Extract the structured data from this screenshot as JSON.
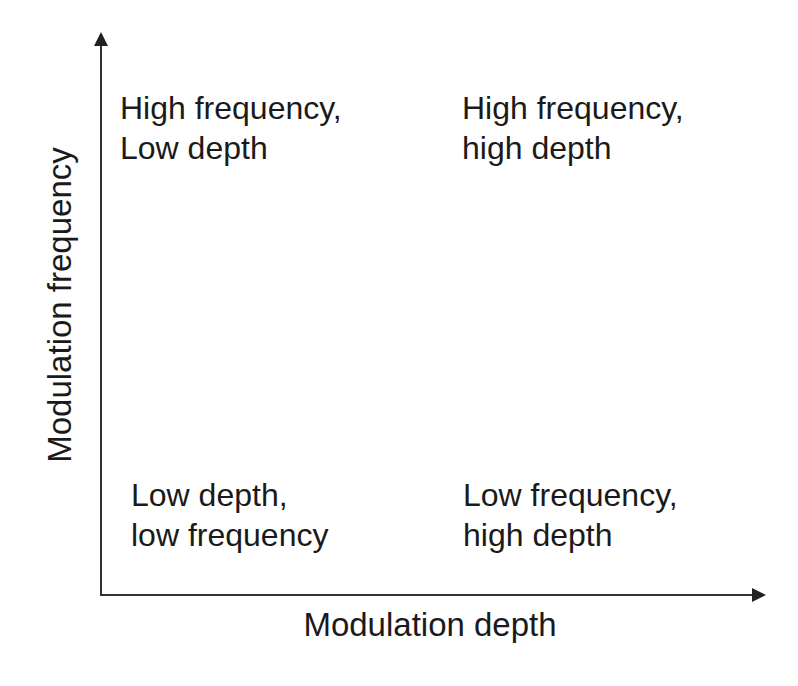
{
  "diagram": {
    "type": "2x2 quadrant",
    "x_axis_label": "Modulation depth",
    "y_axis_label": "Modulation frequency",
    "quadrants": {
      "top_left": {
        "line1": "High frequency,",
        "line2": "Low depth"
      },
      "top_right": {
        "line1": "High frequency,",
        "line2": "high depth"
      },
      "bottom_left": {
        "line1": "Low depth,",
        "line2": "low frequency"
      },
      "bottom_right": {
        "line1": "Low frequency,",
        "line2": "high depth"
      }
    }
  }
}
